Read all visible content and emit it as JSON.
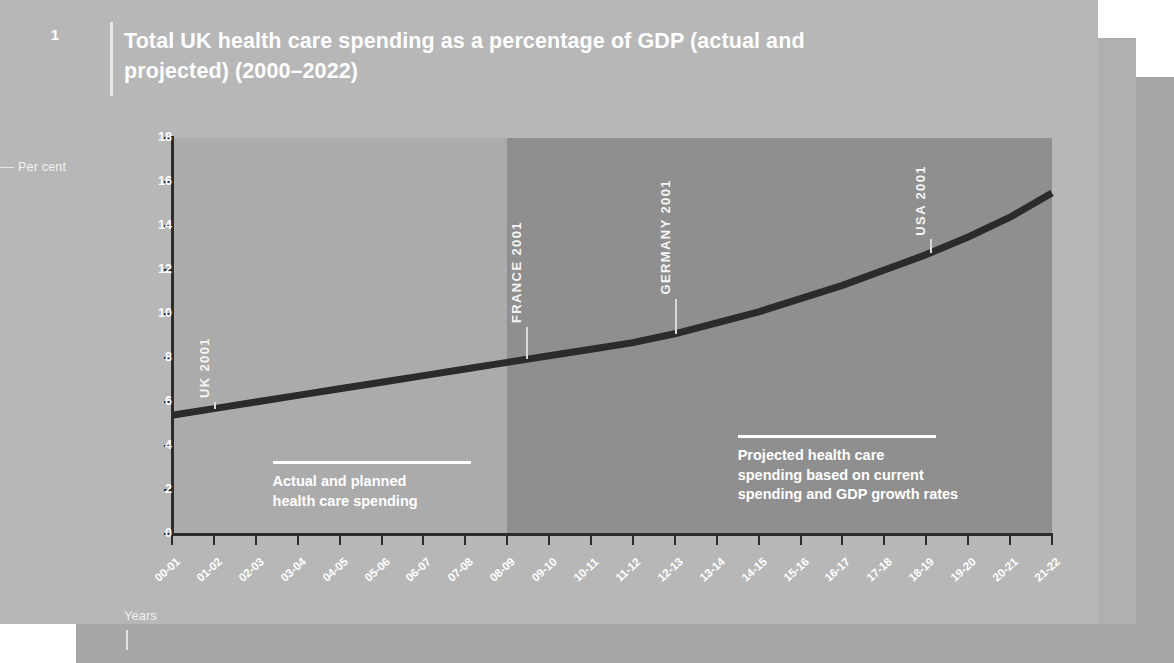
{
  "figure": {
    "number": "1",
    "title": "Total UK health care spending as a percentage\nof GDP (actual and projected) (2000–2022)"
  },
  "colors": {
    "card_front": "#b7b7b7",
    "card_mid": "#b0b0b0",
    "card_back": "#a6a6a6",
    "band_actual": "#ababab",
    "band_projected": "#8f8f8f",
    "line": "#2b2b2b",
    "text_light": "#ffffff"
  },
  "axes": {
    "y_label": "Per cent",
    "x_label": "Years",
    "y_ticks": [
      "0",
      "2",
      "4",
      "6",
      "8",
      "10",
      "12",
      "14",
      "16",
      "18"
    ],
    "y_min": 0,
    "y_max": 18,
    "x_ticks": [
      "00-01",
      "01-02",
      "02-03",
      "03-04",
      "04-05",
      "05-06",
      "06-07",
      "07-08",
      "08-09",
      "09-10",
      "10-11",
      "11-12",
      "12-13",
      "13-14",
      "14-15",
      "15-16",
      "16-17",
      "17-18",
      "18-19",
      "19-20",
      "20-21",
      "21-22"
    ]
  },
  "captions": {
    "left": "Actual and planned\nhealth care spending",
    "right": "Projected health care\nspending based on current\nspending and GDP growth rates"
  },
  "benchmarks": [
    {
      "label": "UK 2001",
      "value": 6.0,
      "x_index": 1
    },
    {
      "label": "FRANCE 2001",
      "value": 9.4,
      "x_index": 8.45
    },
    {
      "label": "GERMANY 2001",
      "value": 10.7,
      "x_index": 12.0
    },
    {
      "label": "USA 2001",
      "value": 13.4,
      "x_index": 18.1
    }
  ],
  "chart_data": {
    "type": "line",
    "title": "Total UK health care spending as a percentage of GDP (actual and projected) (2000–2022)",
    "xlabel": "Years",
    "ylabel": "Per cent",
    "ylim": [
      0,
      18
    ],
    "ytick_step": 2,
    "grid": false,
    "legend": "none",
    "categories": [
      "00-01",
      "01-02",
      "02-03",
      "03-04",
      "04-05",
      "05-06",
      "06-07",
      "07-08",
      "08-09",
      "09-10",
      "10-11",
      "11-12",
      "12-13",
      "13-14",
      "14-15",
      "15-16",
      "16-17",
      "17-18",
      "18-19",
      "19-20",
      "20-21",
      "21-22"
    ],
    "series": [
      {
        "name": "Total UK health care spending (% of GDP)",
        "values": [
          5.4,
          5.7,
          6.0,
          6.3,
          6.6,
          6.9,
          7.2,
          7.5,
          7.8,
          8.1,
          8.4,
          8.7,
          9.1,
          9.6,
          10.1,
          10.7,
          11.3,
          12.0,
          12.7,
          13.5,
          14.4,
          15.5
        ]
      }
    ],
    "regions": [
      {
        "name": "Actual and planned health care spending",
        "from": "00-01",
        "to": "08-09",
        "color": "#ababab"
      },
      {
        "name": "Projected health care spending based on current spending and GDP growth rates",
        "from": "08-09",
        "to": "21-22",
        "color": "#8f8f8f"
      }
    ],
    "annotations": [
      {
        "text": "UK 2001",
        "value": 6.0
      },
      {
        "text": "FRANCE 2001",
        "value": 9.4
      },
      {
        "text": "GERMANY 2001",
        "value": 10.7
      },
      {
        "text": "USA 2001",
        "value": 13.4
      }
    ]
  }
}
